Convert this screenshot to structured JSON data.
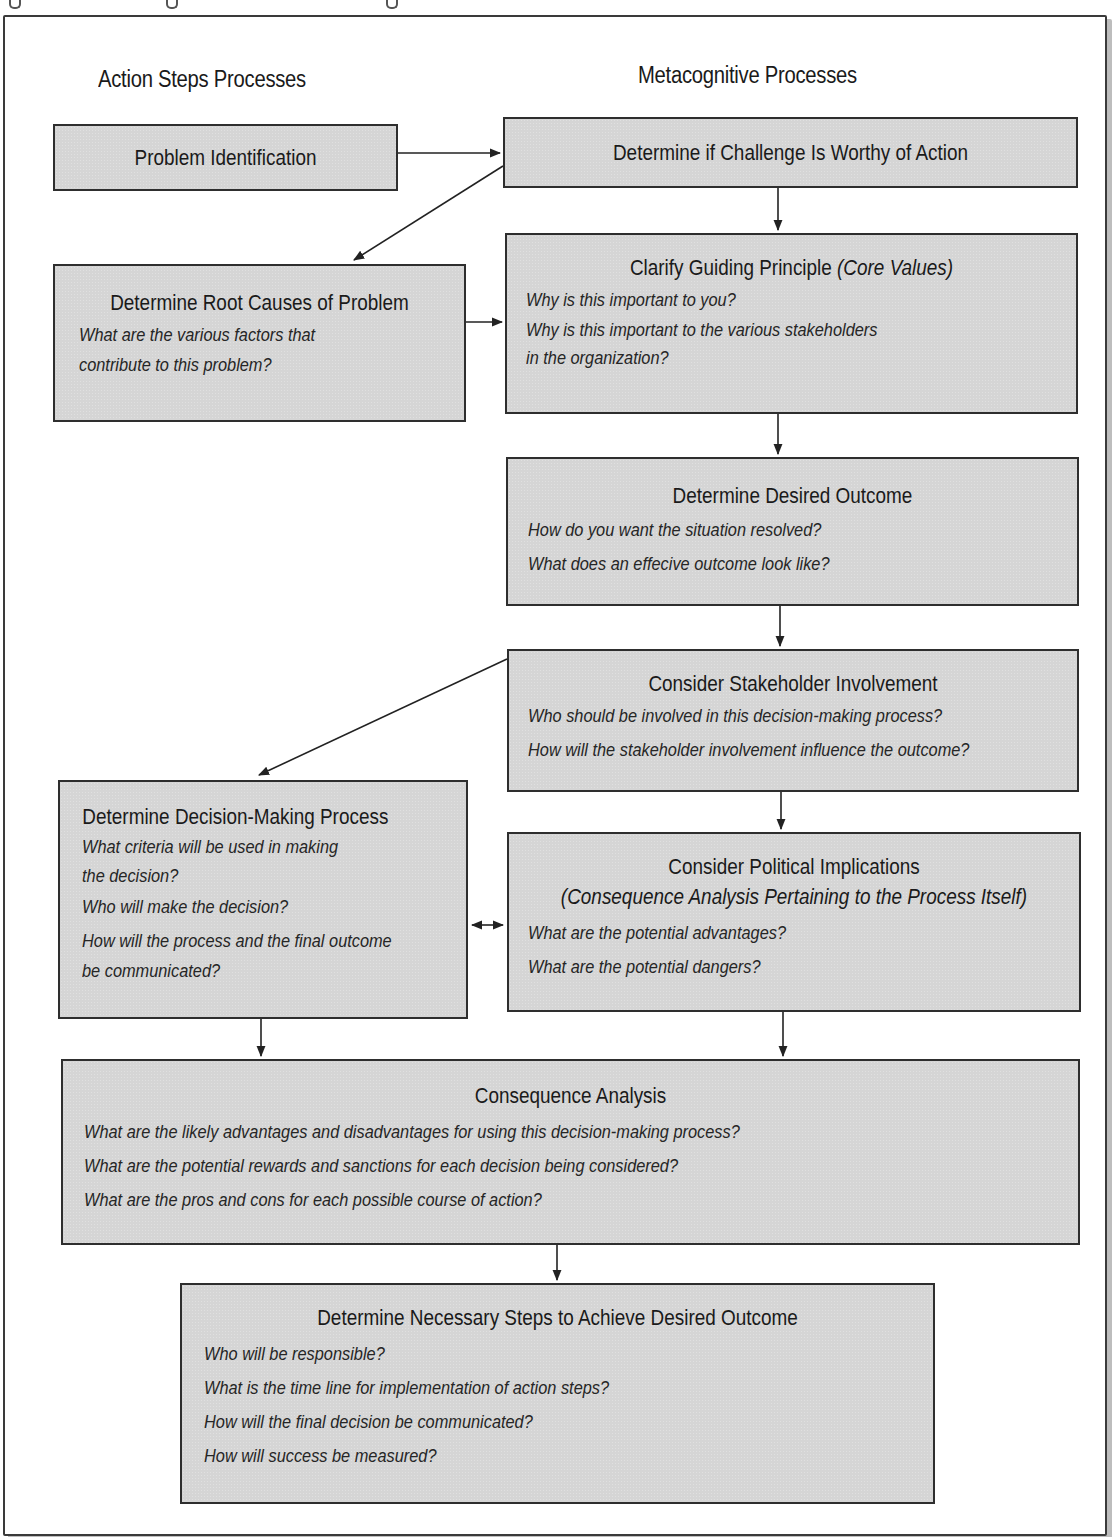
{
  "columns": {
    "left_heading": "Action Steps Processes",
    "right_heading": "Metacognitive Processes"
  },
  "boxes": {
    "problem_identification": {
      "title": "Problem Identification"
    },
    "challenge_worthy": {
      "title": "Determine if Challenge Is Worthy of Action"
    },
    "root_causes": {
      "title": "Determine Root Causes of Problem",
      "questions": [
        "What are the various factors that",
        "contribute to this problem?"
      ]
    },
    "guiding_principle": {
      "title": "Clarify Guiding Principle",
      "title_italic": "(Core Values)",
      "questions": [
        "Why is this important to you?",
        "Why is this important to the various stakeholders",
        "in the organization?"
      ]
    },
    "desired_outcome": {
      "title": "Determine Desired Outcome",
      "questions": [
        "How do you want the situation resolved?",
        "What does an effecive outcome look like?"
      ]
    },
    "stakeholder_involvement": {
      "title": "Consider Stakeholder Involvement",
      "questions": [
        "Who should be involved in this decision-making process?",
        "How will the stakeholder involvement influence the outcome?"
      ]
    },
    "decision_making_process": {
      "title": "Determine Decision-Making Process",
      "questions": [
        "What criteria will be used in making",
        "the decision?",
        "Who will make the decision?",
        "How will the process and the final outcome",
        "be communicated?"
      ]
    },
    "political_implications": {
      "title": "Consider Political Implications",
      "subtitle": "(Consequence Analysis Pertaining to the Process Itself)",
      "questions": [
        "What are the potential advantages?",
        "What are the potential dangers?"
      ]
    },
    "consequence_analysis": {
      "title": "Consequence Analysis",
      "questions": [
        "What are the likely advantages and disadvantages for using this decision-making process?",
        "What are the potential rewards and sanctions for each decision being considered?",
        "What are the pros and cons for each possible course of action?"
      ]
    },
    "necessary_steps": {
      "title": "Determine Necessary Steps to Achieve Desired Outcome",
      "questions": [
        "Who will be responsible?",
        "What is the time line for implementation of action steps?",
        "How will the final decision be communicated?",
        "How will success be measured?"
      ]
    }
  },
  "colors": {
    "box_fill": "#d5d5d5",
    "box_border": "#2e2e2e",
    "arrow": "#222222"
  }
}
